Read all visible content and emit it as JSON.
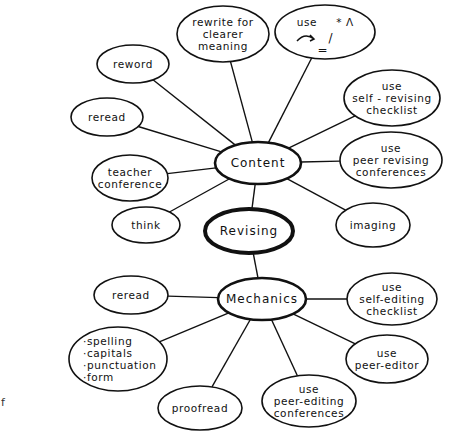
{
  "diagram": {
    "title": "Revising",
    "center": {
      "id": "revising",
      "label": "Revising"
    },
    "hubs": [
      {
        "id": "content",
        "label": "Content"
      },
      {
        "id": "mechanics",
        "label": "Mechanics"
      }
    ],
    "content_nodes": [
      {
        "id": "rewrite",
        "lines": [
          "rewrite for",
          "clearer",
          "meaning"
        ]
      },
      {
        "id": "symbols",
        "lines": [
          "use",
          "* Λ",
          "/",
          "="
        ],
        "note": "use editing symbols: asterisk, caret, arrow, slash, equals"
      },
      {
        "id": "reword",
        "lines": [
          "reword"
        ]
      },
      {
        "id": "reread-content",
        "lines": [
          "reread"
        ]
      },
      {
        "id": "self-revising",
        "lines": [
          "use",
          "self - revising",
          "checklist"
        ]
      },
      {
        "id": "peer-revising",
        "lines": [
          "use",
          "peer revising",
          "conferences"
        ]
      },
      {
        "id": "teacher-conference",
        "lines": [
          "teacher",
          "conference"
        ]
      },
      {
        "id": "think",
        "lines": [
          "think"
        ]
      },
      {
        "id": "imaging",
        "lines": [
          "imaging"
        ]
      }
    ],
    "mechanics_nodes": [
      {
        "id": "reread-mechanics",
        "lines": [
          "reread"
        ]
      },
      {
        "id": "self-editing",
        "lines": [
          "use",
          "self-editing",
          "checklist"
        ]
      },
      {
        "id": "checklist-items",
        "lines": [
          "·spelling",
          "·capitals",
          "·punctuation",
          "·form"
        ]
      },
      {
        "id": "peer-editor",
        "lines": [
          "use",
          "peer-editor"
        ]
      },
      {
        "id": "peer-editing",
        "lines": [
          "use",
          "peer-editing",
          "conferences"
        ]
      },
      {
        "id": "proofread",
        "lines": [
          "proofread"
        ]
      }
    ],
    "edges": [
      [
        "revising",
        "content"
      ],
      [
        "revising",
        "mechanics"
      ],
      [
        "content",
        "rewrite"
      ],
      [
        "content",
        "symbols"
      ],
      [
        "content",
        "reword"
      ],
      [
        "content",
        "reread-content"
      ],
      [
        "content",
        "self-revising"
      ],
      [
        "content",
        "peer-revising"
      ],
      [
        "content",
        "teacher-conference"
      ],
      [
        "content",
        "think"
      ],
      [
        "content",
        "imaging"
      ],
      [
        "mechanics",
        "reread-mechanics"
      ],
      [
        "mechanics",
        "self-editing"
      ],
      [
        "mechanics",
        "checklist-items"
      ],
      [
        "mechanics",
        "peer-editor"
      ],
      [
        "mechanics",
        "peer-editing"
      ],
      [
        "mechanics",
        "proofread"
      ]
    ],
    "stray_text": "f",
    "colors": {
      "ink": "#111111",
      "background": "#ffffff"
    }
  }
}
